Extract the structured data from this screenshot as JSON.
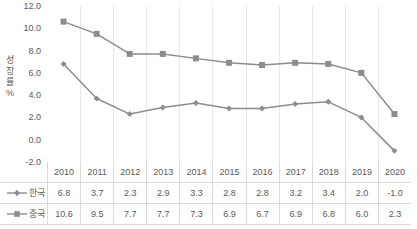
{
  "chart_data": {
    "type": "line",
    "title": "",
    "xlabel": "",
    "ylabel": "성장률 %",
    "ylabel_lines": [
      "성",
      "장",
      "률",
      "%"
    ],
    "categories": [
      "2010",
      "2011",
      "2012",
      "2013",
      "2014",
      "2015",
      "2016",
      "2017",
      "2018",
      "2019",
      "2020"
    ],
    "series": [
      {
        "name": "한국",
        "marker": "diamond",
        "color": "#8c8c8c",
        "values": [
          6.8,
          3.7,
          2.3,
          2.9,
          3.3,
          2.8,
          2.8,
          3.2,
          3.4,
          2.0,
          -1.0
        ],
        "labels": [
          "6.8",
          "3.7",
          "2.3",
          "2.9",
          "3.3",
          "2.8",
          "2.8",
          "3.2",
          "3.4",
          "2.0",
          "-1.0"
        ]
      },
      {
        "name": "중국",
        "marker": "square",
        "color": "#8c8c8c",
        "values": [
          10.6,
          9.5,
          7.7,
          7.7,
          7.3,
          6.9,
          6.7,
          6.9,
          6.8,
          6.0,
          2.3
        ],
        "labels": [
          "10.6",
          "9.5",
          "7.7",
          "7.7",
          "7.3",
          "6.9",
          "6.7",
          "6.9",
          "6.8",
          "6.0",
          "2.3"
        ]
      }
    ],
    "ylim": [
      -2.0,
      12.0
    ],
    "ytick_step": 2.0,
    "yticks": [
      "12.0",
      "10.0",
      "8.0",
      "6.0",
      "4.0",
      "2.0",
      "0.0",
      "-2.0"
    ],
    "ytick_values": [
      12.0,
      10.0,
      8.0,
      6.0,
      4.0,
      2.0,
      0.0,
      -2.0
    ],
    "grid": "vertical",
    "legend_position": "data-table-left",
    "data_table": true,
    "background": "#ffffff",
    "gridline_color": "#e8e8e8"
  }
}
